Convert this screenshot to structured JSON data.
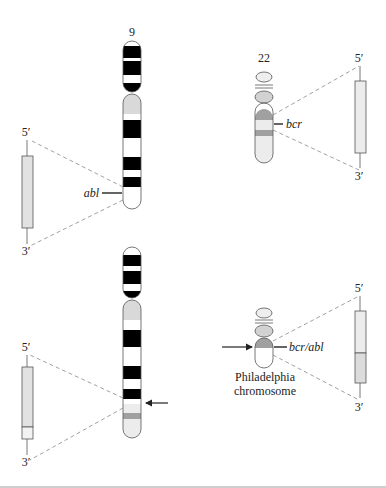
{
  "diagram": {
    "type": "chromosome translocation (Philadelphia chromosome)",
    "chromosome_9_label": "9",
    "chromosome_22_label": "22",
    "gene_abl_label": "abl",
    "gene_bcr_label": "bcr",
    "fusion_gene_label": "bcr/abl",
    "philadelphia_label_line1": "Philadelphia",
    "philadelphia_label_line2": "chromosome",
    "five_prime": "5′",
    "three_prime": "3′",
    "colors": {
      "band_dark": "#000000",
      "band_gray": "#d9d9d9",
      "band_mid": "#9e9e9e",
      "outline": "#555555",
      "gene_fill": "#e2e2e2",
      "dashed": "#888888",
      "divider": "#cfcfcf"
    },
    "panels": [
      {
        "position": "top-left",
        "element": "normal chromosome 9 with abl gene"
      },
      {
        "position": "top-right",
        "element": "normal chromosome 22 with bcr gene"
      },
      {
        "position": "bottom-left",
        "element": "derivative chromosome 9 (arrow at breakpoint)"
      },
      {
        "position": "bottom-right",
        "element": "Philadelphia chromosome with bcr/abl fusion gene"
      }
    ]
  }
}
